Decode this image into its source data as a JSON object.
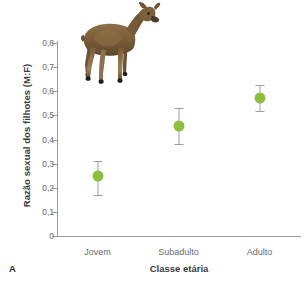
{
  "panel": {
    "label": "A"
  },
  "chart_data": {
    "type": "scatter",
    "title": "",
    "xlabel": "Classe etária",
    "ylabel": "Razão sexual dos filhotes (M:F)",
    "categories": [
      "Jovem",
      "Subadulto",
      "Adulto"
    ],
    "values": [
      0.25,
      0.455,
      0.573
    ],
    "error_low": [
      0.17,
      0.38,
      0.52
    ],
    "error_high": [
      0.31,
      0.53,
      0.625
    ],
    "ylim": [
      0,
      0.8
    ],
    "yticks": [
      0,
      0.1,
      0.2,
      0.3,
      0.4,
      0.5,
      0.6,
      0.7,
      0.8
    ],
    "ytick_labels": [
      "0",
      "0,1",
      "0,2",
      "0,3",
      "0,4",
      "0,5",
      "0,6",
      "0,7",
      "0,8"
    ],
    "grid": false,
    "legend": "none",
    "marker_color": "#8cbe3f",
    "errorbar_color": "#9d9d9d",
    "axis_color": "#9a9a9a"
  },
  "illustration": {
    "name": "deer-photo",
    "description": "Veado / cervo"
  }
}
